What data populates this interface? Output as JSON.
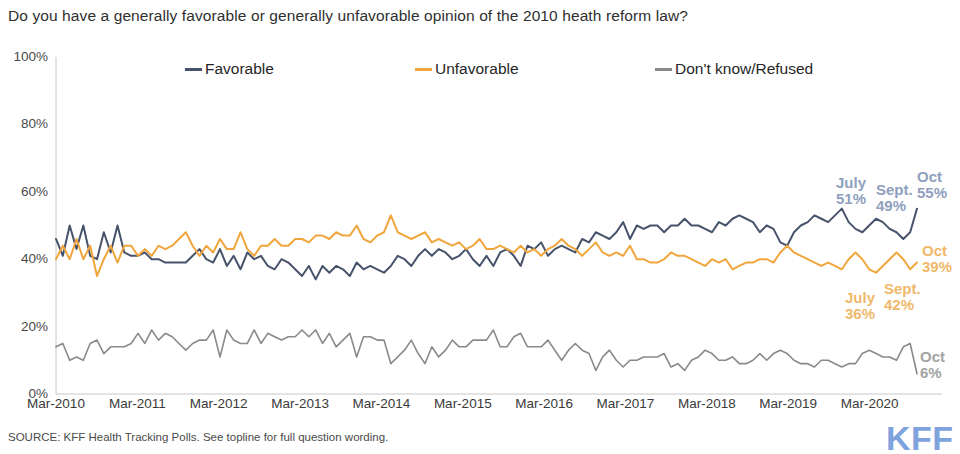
{
  "title": "Do you have a generally favorable or generally unfavorable opinion of the 2010 heath reform law?",
  "source": "SOURCE: KFF Health Tracking Polls. See topline for full question wording.",
  "logo": "KFF",
  "colors": {
    "favorable": "#47536b",
    "unfavorable": "#f0a63c",
    "dontknow": "#8a8a8a",
    "annot_blue": "#8f9fbe",
    "annot_orange": "#f0b96a",
    "annot_gray": "#a3a3a3",
    "logo": "#7fa3dd",
    "axis": "#c8c8c8"
  },
  "chart_data": {
    "type": "line",
    "title": "Do you have a generally favorable or generally unfavorable opinion of the 2010 heath reform law?",
    "xlabel": "",
    "ylabel": "",
    "ylim": [
      0,
      100
    ],
    "yticks": [
      "0%",
      "20%",
      "40%",
      "60%",
      "80%",
      "100%"
    ],
    "ytick_values": [
      0,
      20,
      40,
      60,
      80,
      100
    ],
    "xticks": [
      "Mar-2010",
      "Mar-2011",
      "Mar-2012",
      "Mar-2013",
      "Mar-2014",
      "Mar-2015",
      "Mar-2016",
      "Mar-2017",
      "Mar-2018",
      "Mar-2019",
      "Mar-2020"
    ],
    "xtick_values": [
      0,
      12,
      24,
      36,
      48,
      60,
      72,
      84,
      96,
      108,
      120
    ],
    "x_range": [
      0,
      127
    ],
    "grid": false,
    "legend_position": "top",
    "series": [
      {
        "name": "Favorable",
        "color": "#47536b",
        "values": [
          46,
          41,
          50,
          43,
          50,
          41,
          40,
          48,
          42,
          50,
          42,
          41,
          41,
          42,
          40,
          40,
          39,
          39,
          39,
          39,
          41,
          43,
          40,
          39,
          43,
          38,
          41,
          37,
          42,
          40,
          41,
          38,
          37,
          40,
          39,
          37,
          35,
          38,
          34,
          38,
          36,
          38,
          37,
          35,
          39,
          37,
          38,
          37,
          36,
          38,
          41,
          40,
          38,
          41,
          43,
          41,
          43,
          42,
          40,
          41,
          43,
          40,
          38,
          41,
          38,
          42,
          43,
          41,
          38,
          44,
          43,
          45,
          41,
          43,
          44,
          43,
          42,
          46,
          45,
          48,
          47,
          46,
          48,
          51,
          46,
          50,
          49,
          50,
          50,
          48,
          50,
          50,
          52,
          50,
          50,
          49,
          48,
          51,
          50,
          52,
          53,
          52,
          51,
          48,
          50,
          49,
          45,
          44,
          48,
          50,
          51,
          53,
          52,
          51,
          53,
          55,
          51,
          49,
          48,
          50,
          52,
          51,
          49,
          48,
          46,
          48,
          55
        ]
      },
      {
        "name": "Unfavorable",
        "color": "#f0a63c",
        "values": [
          40,
          44,
          40,
          46,
          40,
          44,
          35,
          40,
          44,
          39,
          44,
          44,
          41,
          43,
          41,
          44,
          43,
          44,
          46,
          48,
          44,
          41,
          44,
          42,
          46,
          43,
          43,
          48,
          43,
          41,
          44,
          44,
          46,
          44,
          44,
          46,
          46,
          45,
          47,
          47,
          46,
          48,
          47,
          47,
          50,
          46,
          45,
          47,
          48,
          53,
          48,
          47,
          46,
          47,
          48,
          45,
          46,
          45,
          44,
          45,
          43,
          44,
          46,
          43,
          43,
          44,
          43,
          42,
          44,
          42,
          43,
          41,
          43,
          44,
          46,
          44,
          43,
          41,
          43,
          45,
          42,
          41,
          42,
          41,
          44,
          40,
          40,
          39,
          39,
          40,
          42,
          41,
          41,
          40,
          39,
          38,
          40,
          39,
          40,
          37,
          38,
          39,
          39,
          40,
          40,
          39,
          42,
          44,
          42,
          41,
          40,
          39,
          38,
          39,
          38,
          37,
          40,
          42,
          40,
          37,
          36,
          38,
          40,
          42,
          40,
          37,
          39
        ]
      },
      {
        "name": "Don't know/Refused",
        "color": "#8a8a8a",
        "values": [
          14,
          15,
          10,
          11,
          10,
          15,
          16,
          12,
          14,
          14,
          14,
          15,
          18,
          15,
          19,
          16,
          18,
          17,
          15,
          13,
          15,
          16,
          16,
          19,
          11,
          19,
          16,
          15,
          15,
          19,
          15,
          18,
          17,
          16,
          17,
          17,
          19,
          17,
          19,
          15,
          18,
          14,
          16,
          18,
          11,
          17,
          17,
          16,
          16,
          9,
          11,
          13,
          16,
          12,
          9,
          14,
          11,
          13,
          16,
          14,
          14,
          16,
          16,
          16,
          19,
          14,
          14,
          17,
          18,
          14,
          14,
          14,
          16,
          13,
          10,
          13,
          15,
          13,
          12,
          7,
          11,
          13,
          10,
          8,
          10,
          10,
          11,
          11,
          11,
          12,
          8,
          9,
          7,
          10,
          11,
          13,
          12,
          10,
          10,
          11,
          9,
          9,
          10,
          12,
          10,
          12,
          13,
          12,
          10,
          9,
          9,
          8,
          10,
          10,
          9,
          8,
          9,
          9,
          12,
          13,
          12,
          11,
          11,
          10,
          14,
          15,
          6
        ]
      }
    ],
    "annotations": [
      {
        "series": "Favorable",
        "period": "July",
        "value": "51%",
        "color": "#8f9fbe",
        "x": 836,
        "y": 175
      },
      {
        "series": "Favorable",
        "period": "Sept.",
        "value": "49%",
        "color": "#8f9fbe",
        "x": 876,
        "y": 182
      },
      {
        "series": "Favorable",
        "period": "Oct",
        "value": "55%",
        "color": "#8f9fbe",
        "x": 917,
        "y": 169
      },
      {
        "series": "Unfavorable",
        "period": "Oct",
        "value": "39%",
        "color": "#f0b96a",
        "x": 922,
        "y": 243
      },
      {
        "series": "Unfavorable",
        "period": "Sept.",
        "value": "42%",
        "color": "#f0b96a",
        "x": 884,
        "y": 281
      },
      {
        "series": "Unfavorable",
        "period": "July",
        "value": "36%",
        "color": "#f0b96a",
        "x": 845,
        "y": 290
      },
      {
        "series": "Don't know/Refused",
        "period": "Oct",
        "value": "6%",
        "color": "#a3a3a3",
        "x": 920,
        "y": 349
      }
    ]
  },
  "legend": {
    "items": [
      {
        "label": "Favorable",
        "color": "#47536b"
      },
      {
        "label": "Unfavorable",
        "color": "#f0a63c"
      },
      {
        "label": "Don't know/Refused",
        "color": "#8a8a8a"
      }
    ]
  }
}
